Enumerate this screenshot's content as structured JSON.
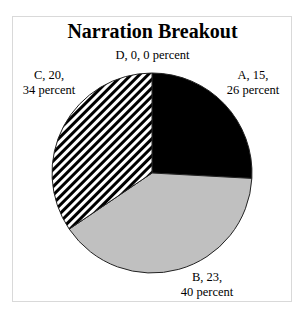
{
  "chart_data": {
    "type": "pie",
    "title": "Narration Breakout",
    "categories": [
      "A",
      "B",
      "C",
      "D"
    ],
    "values": [
      15,
      23,
      20,
      0
    ],
    "percents": [
      26,
      40,
      34,
      0
    ],
    "slices": [
      {
        "name": "A",
        "value": 15,
        "percent": 26,
        "fill": "#000000",
        "pattern": "solid"
      },
      {
        "name": "B",
        "value": 23,
        "percent": 40,
        "fill": "#c0c0c0",
        "pattern": "solid-gray"
      },
      {
        "name": "C",
        "value": 20,
        "percent": 34,
        "fill": "#ffffff",
        "pattern": "diagonal-stripes"
      },
      {
        "name": "D",
        "value": 0,
        "percent": 0,
        "fill": "#ffffff",
        "pattern": "none"
      }
    ],
    "legend": "none",
    "start_angle": "12 o'clock, clockwise"
  },
  "labels": {
    "A_line1": "A, 15,",
    "A_line2": "26 percent",
    "B_line1": "B, 23,",
    "B_line2": "40 percent",
    "C_line1": "C, 20,",
    "C_line2": "34 percent",
    "D_line1": "D, 0, 0 percent"
  }
}
